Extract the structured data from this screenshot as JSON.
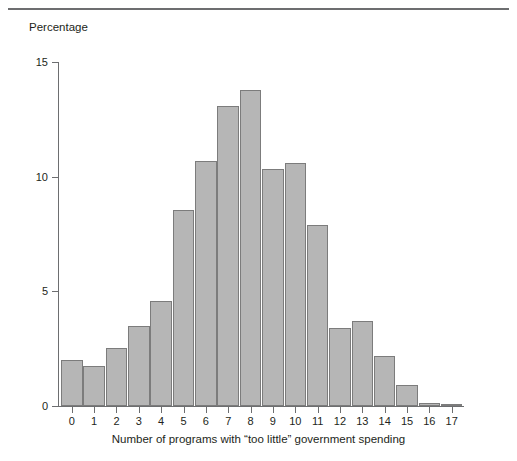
{
  "caption": {
    "text": "",
    "visible": false
  },
  "chart_data": {
    "type": "bar",
    "title": "",
    "xlabel": "Number of programs with “too little” government spending",
    "ylabel": "Percentage",
    "categories": [
      "0",
      "1",
      "2",
      "3",
      "4",
      "5",
      "6",
      "7",
      "8",
      "9",
      "10",
      "11",
      "12",
      "13",
      "14",
      "15",
      "16",
      "17"
    ],
    "values": [
      2.0,
      1.75,
      2.55,
      3.5,
      4.6,
      8.55,
      10.7,
      13.1,
      13.8,
      10.35,
      10.6,
      7.9,
      3.4,
      3.7,
      2.2,
      0.9,
      0.15,
      0.07
    ],
    "ylim": [
      0,
      15
    ],
    "yticks": [
      0,
      5,
      10,
      15
    ],
    "ytick_labels": [
      "0",
      "5",
      "10",
      "15"
    ],
    "grid": false,
    "legend": null,
    "bar_color": "#b6b6b6",
    "bar_border_color": "#7c7c7c",
    "axis_color": "#6d6e70"
  }
}
